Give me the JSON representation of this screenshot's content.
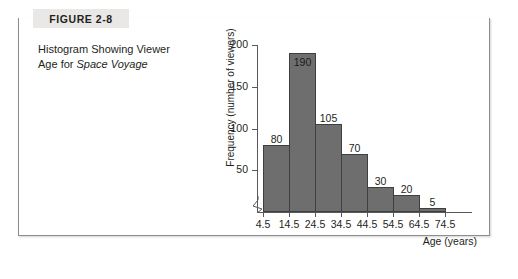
{
  "figure": {
    "tab_label": "FIGURE 2-8",
    "caption_line1": "Histogram Showing Viewer",
    "caption_line2_prefix": "Age for ",
    "caption_line2_italic": "Space Voyage"
  },
  "colors": {
    "bar_fill": "#6e6e6e",
    "bar_stroke": "#3f3f3f",
    "axis": "#58595b",
    "frame": "#8d8d8d",
    "tab_bg": "#e9e8e6",
    "text": "#231f20"
  },
  "chart_data": {
    "type": "bar",
    "title": "Histogram Showing Viewer Age for Space Voyage",
    "xlabel": "Age (years)",
    "ylabel": "Frequency (number of viewers)",
    "categories": [
      "4.5-14.5",
      "14.5-24.5",
      "24.5-34.5",
      "34.5-44.5",
      "44.5-54.5",
      "54.5-64.5",
      "64.5-74.5"
    ],
    "values": [
      80,
      190,
      105,
      70,
      30,
      20,
      5
    ],
    "bin_edges": [
      "4.5",
      "14.5",
      "24.5",
      "34.5",
      "44.5",
      "54.5",
      "64.5",
      "74.5"
    ],
    "xtick_labels": [
      "4.5",
      "14.5",
      "24.5",
      "34.5",
      "44.5",
      "54.5",
      "64.5",
      "74.5"
    ],
    "ytick_labels": [
      "50",
      "100",
      "150",
      "200"
    ],
    "ytick_values": [
      50,
      100,
      150,
      200
    ],
    "ylim": [
      0,
      200
    ],
    "grid": false,
    "legend": false,
    "axis_break": "y-axis zigzag near origin",
    "value_label_positions": [
      "above",
      "inside",
      "above",
      "above",
      "above",
      "above",
      "above"
    ]
  }
}
